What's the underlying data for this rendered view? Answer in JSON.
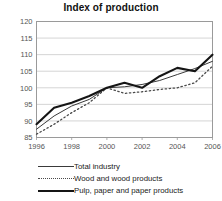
{
  "chart_data": {
    "type": "line",
    "title": "Index of production",
    "xlabel": "",
    "ylabel": "",
    "xlim": [
      1996,
      2006
    ],
    "ylim": [
      85,
      120
    ],
    "yticks": [
      85,
      90,
      95,
      100,
      105,
      110,
      115,
      120
    ],
    "xticks": [
      1996,
      1998,
      2000,
      2002,
      2004,
      2006
    ],
    "x": [
      1996,
      1997,
      1998,
      1999,
      2000,
      2001,
      2002,
      2003,
      2004,
      2005,
      2006
    ],
    "grid": "horizontal",
    "legend_position": "bottom",
    "series": [
      {
        "name": "Total industry",
        "style": "solid-thin",
        "color": "#3a3a3a",
        "values": [
          87.5,
          91.5,
          94.5,
          96.5,
          100.0,
          100.3,
          101.0,
          102.2,
          104.0,
          105.8,
          108.0
        ]
      },
      {
        "name": "Wood and wood products",
        "style": "dotted",
        "color": "#4a4a4a",
        "values": [
          86.0,
          89.0,
          92.5,
          95.5,
          100.0,
          98.3,
          98.8,
          99.5,
          100.0,
          101.5,
          106.5
        ]
      },
      {
        "name": "Pulp, paper and paper products",
        "style": "solid-thick",
        "color": "#151515",
        "values": [
          89.0,
          94.0,
          95.5,
          97.5,
          100.0,
          101.5,
          100.0,
          103.5,
          106.0,
          105.0,
          110.0
        ]
      }
    ]
  },
  "legend": {
    "items": [
      {
        "label": "Total industry"
      },
      {
        "label": "Wood and wood products"
      },
      {
        "label": "Pulp, paper and paper products"
      }
    ]
  }
}
